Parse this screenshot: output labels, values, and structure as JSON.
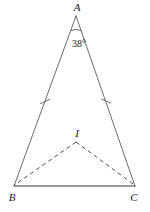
{
  "figure": {
    "type": "geometry-diagram",
    "background_color": "#ffffff",
    "stroke_color": "#4a4a4a",
    "baseline_color": "#6e6e6e",
    "label_color": "#1a1a1a"
  },
  "vertices": {
    "A": {
      "label": "A",
      "x": 76,
      "y": 16,
      "label_x": 77,
      "label_y": 11
    },
    "B": {
      "label": "B",
      "x": 14,
      "y": 186,
      "label_x": 11,
      "label_y": 200
    },
    "C": {
      "label": "C",
      "x": 135,
      "y": 186,
      "label_x": 132,
      "label_y": 200
    },
    "I": {
      "label": "I",
      "x": 76,
      "y": 142,
      "label_x": 77,
      "label_y": 136
    }
  },
  "angle_marks": [
    {
      "at": "A",
      "value": "38",
      "unit": "°",
      "label": "38°",
      "label_x": 70,
      "label_y": 47
    }
  ],
  "congruence_ticks": [
    {
      "on_segment": "AB",
      "x": 45,
      "y": 102,
      "count": 1
    },
    {
      "on_segment": "AC",
      "x": 106,
      "y": 101,
      "count": 1
    }
  ],
  "segments": [
    {
      "name": "AB",
      "from": "A",
      "to": "B",
      "style": "solid"
    },
    {
      "name": "AC",
      "from": "A",
      "to": "C",
      "style": "solid"
    },
    {
      "name": "BC",
      "from": "B",
      "to": "C",
      "style": "solid-thick"
    },
    {
      "name": "IB",
      "from": "I",
      "to": "B",
      "style": "dashed"
    },
    {
      "name": "IC",
      "from": "I",
      "to": "C",
      "style": "dashed"
    }
  ]
}
